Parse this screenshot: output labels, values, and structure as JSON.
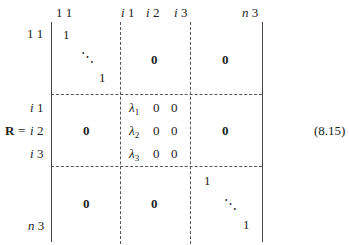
{
  "equation": {
    "lhs": "R",
    "equals": "=",
    "number": "(8.15)"
  },
  "column_headers": [
    {
      "var": "",
      "num": "1 1"
    },
    {
      "var": "i",
      "num": "1"
    },
    {
      "var": "i",
      "num": "2"
    },
    {
      "var": "i",
      "num": "3"
    },
    {
      "var": "n",
      "num": "3"
    }
  ],
  "row_labels": [
    {
      "var": "",
      "num": "1 1"
    },
    {
      "var": "i",
      "num": "1"
    },
    {
      "var": "i",
      "num": "2"
    },
    {
      "var": "i",
      "num": "3"
    },
    {
      "var": "n",
      "num": "3"
    }
  ],
  "blocks": {
    "top_left": {
      "first": "1",
      "dots": "⋱",
      "last": "1"
    },
    "top_mid": "0",
    "top_right": "0",
    "mid_left": "0",
    "mid_center": [
      {
        "lambda": "λ",
        "sub": "1",
        "c2": "0",
        "c3": "0"
      },
      {
        "lambda": "λ",
        "sub": "2",
        "c2": "0",
        "c3": "0"
      },
      {
        "lambda": "λ",
        "sub": "3",
        "c2": "0",
        "c3": "0"
      }
    ],
    "mid_right": "0",
    "bot_left": "0",
    "bot_mid": "0",
    "bot_right": {
      "first": "1",
      "dots": "⋱",
      "last": "1"
    }
  }
}
